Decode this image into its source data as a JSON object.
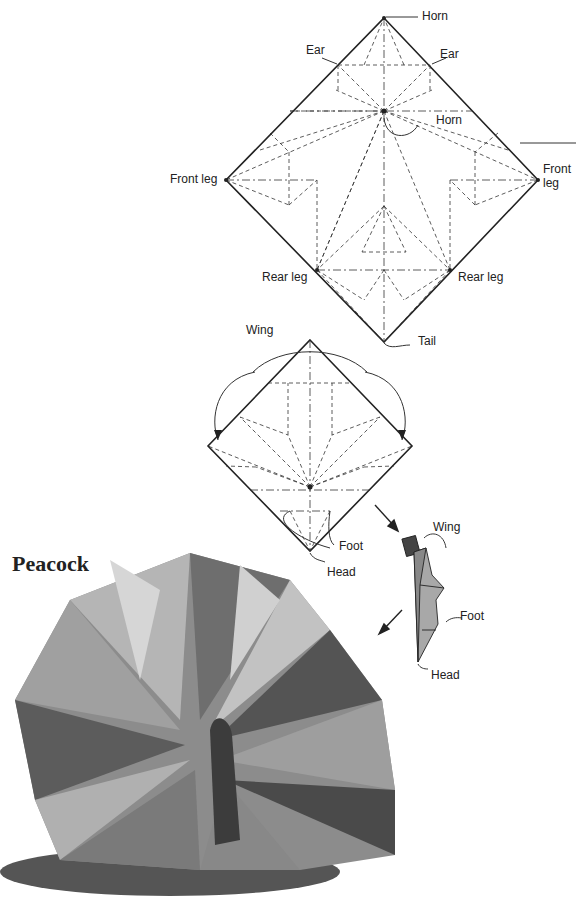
{
  "title": "Peacock",
  "diagram1": {
    "labels": {
      "horn_top": "Horn",
      "ear_left": "Ear",
      "ear_right": "Ear",
      "horn_center": "Horn",
      "front_leg_left": "Front leg",
      "front_leg_right_1": "Front",
      "front_leg_right_2": "leg",
      "rear_leg_left": "Rear leg",
      "rear_leg_right": "Rear leg",
      "tail": "Tail"
    }
  },
  "diagram2": {
    "labels": {
      "wing": "Wing",
      "foot": "Foot",
      "head": "Head"
    }
  },
  "diagram3": {
    "labels": {
      "wing": "Wing",
      "foot": "Foot",
      "head": "Head"
    }
  },
  "photo": {
    "subject": "Folded paper peacock",
    "colors": {
      "light": "#bcbcbc",
      "mid": "#8a8a8a",
      "dark": "#3a3a3a"
    }
  }
}
